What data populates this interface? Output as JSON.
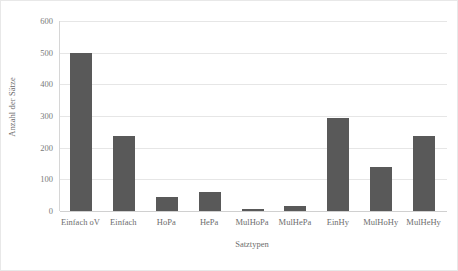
{
  "chart_data": {
    "type": "bar",
    "title": "",
    "xlabel": "Satztypen",
    "ylabel": "Anzahl der Sätze",
    "categories": [
      "Einfach oV",
      "Einfach",
      "HoPa",
      "HePa",
      "MulHoPa",
      "MulHePa",
      "EinHy",
      "MulHoHy",
      "MulHeHy"
    ],
    "values": [
      500,
      236,
      45,
      60,
      5,
      15,
      293,
      140,
      236
    ],
    "ylim": [
      0,
      600
    ],
    "yticks": [
      0,
      100,
      200,
      300,
      400,
      500,
      600
    ],
    "ytick_labels": [
      "0",
      "100",
      "200",
      "300",
      "400",
      "500",
      "600"
    ],
    "grid": true,
    "legend": false,
    "bar_color": "#595959",
    "gridline_color": "#e6e6e6",
    "axis_color": "#d6d6d6",
    "text_color": "#6d6d6d"
  }
}
